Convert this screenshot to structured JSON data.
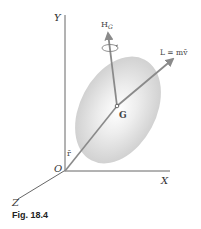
{
  "figure": {
    "caption": "Fig. 18.4",
    "axes": {
      "y_label": "Y",
      "x_label": "X",
      "z_label": "Z",
      "origin_label": "O"
    },
    "points": {
      "center_of_mass_label": "G"
    },
    "vectors": {
      "position_label": "r̄",
      "angular_momentum_label": "H",
      "angular_momentum_subscript": "G",
      "linear_momentum_label": "L = mv̄"
    },
    "colors": {
      "axis": "#555555",
      "vector": "#8a8a8a",
      "body_fill": "#d4d4d4",
      "text": "#333333"
    }
  }
}
